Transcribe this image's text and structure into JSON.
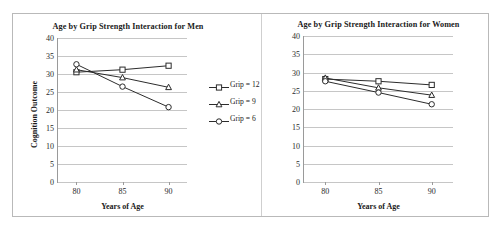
{
  "figure": {
    "border_color": "#b9b9b9",
    "line_color": "#2c2c2c",
    "grid_color": "#c6c6c6"
  },
  "panels": {
    "left": {
      "title": "Age by Grip Strength Interaction for Men",
      "xlabel": "Years of Age",
      "ylabel": "Cognition Outcome",
      "ytick_labels": [
        "40",
        "35",
        "30",
        "25",
        "20",
        "15",
        "10",
        "5",
        "0"
      ],
      "xtick_labels": [
        "80",
        "85",
        "90"
      ]
    },
    "right": {
      "title": "Age by Grip Strength Interaction for Women",
      "xlabel": "Years of Age",
      "ylabel": "",
      "ytick_labels": [
        "40",
        "35",
        "30",
        "25",
        "20",
        "15",
        "10",
        "5",
        "0"
      ],
      "xtick_labels": [
        "80",
        "85",
        "90"
      ]
    }
  },
  "legend": {
    "position": "right-of-left-panel",
    "entries": [
      {
        "label": "Grip = 12",
        "marker": "square-marker"
      },
      {
        "label": "Grip = 9",
        "marker": "triangle-marker"
      },
      {
        "label": "Grip = 6",
        "marker": "circle-marker"
      }
    ]
  },
  "chart_data": [
    {
      "type": "line",
      "title": "Age by Grip Strength Interaction for Men",
      "xlabel": "Years of Age",
      "ylabel": "Cognition Outcome",
      "x": [
        80,
        85,
        90
      ],
      "xlim": [
        78,
        92
      ],
      "ylim": [
        0,
        40
      ],
      "ytick_step": 5,
      "grid": true,
      "legend_position": "right",
      "series": [
        {
          "name": "Grip = 12",
          "marker": "square",
          "values": [
            30.5,
            31.2,
            32.3
          ]
        },
        {
          "name": "Grip = 9",
          "marker": "triangle",
          "values": [
            31.2,
            29.0,
            26.3
          ]
        },
        {
          "name": "Grip = 6",
          "marker": "circle",
          "values": [
            32.7,
            26.5,
            20.8
          ]
        }
      ]
    },
    {
      "type": "line",
      "title": "Age by Grip Strength Interaction for Women",
      "xlabel": "Years of Age",
      "ylabel": "",
      "x": [
        80,
        85,
        90
      ],
      "xlim": [
        78,
        92
      ],
      "ylim": [
        0,
        40
      ],
      "ytick_step": 5,
      "grid": true,
      "legend_position": "none",
      "series": [
        {
          "name": "Grip = 12",
          "marker": "square",
          "values": [
            28.2,
            27.6,
            26.6
          ]
        },
        {
          "name": "Grip = 9",
          "marker": "triangle",
          "values": [
            28.5,
            25.8,
            23.8
          ]
        },
        {
          "name": "Grip = 6",
          "marker": "circle",
          "values": [
            27.6,
            24.5,
            21.3
          ]
        }
      ]
    }
  ]
}
